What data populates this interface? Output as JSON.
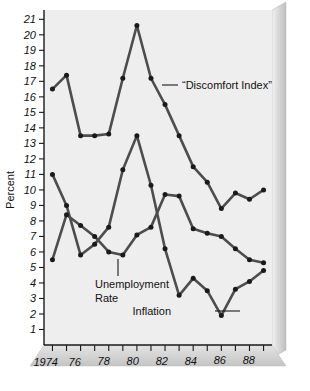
{
  "chart_data": {
    "type": "line",
    "title": "",
    "xlabel": "",
    "ylabel": "Percent",
    "ylim": [
      0,
      21.6
    ],
    "xlim": [
      1973.4,
      1989.6
    ],
    "grid": false,
    "legend_position": "inline-annotations",
    "x": [
      1974,
      1975,
      1976,
      1977,
      1978,
      1979,
      1980,
      1981,
      1982,
      1983,
      1984,
      1985,
      1986,
      1987,
      1988,
      1989
    ],
    "yticks": [
      1,
      2,
      3,
      4,
      5,
      6,
      7,
      8,
      9,
      10,
      11,
      12,
      13,
      14,
      15,
      16,
      17,
      18,
      19,
      20,
      21
    ],
    "ytick_labels": [
      "1",
      "2",
      "3",
      "4",
      "5",
      "6",
      "7",
      "8",
      "9",
      "10",
      "11",
      "12",
      "13",
      "14",
      "15",
      "16",
      "17",
      "18",
      "19",
      "20",
      "21"
    ],
    "xticks": [
      1974,
      1975,
      1976,
      1977,
      1978,
      1979,
      1980,
      1981,
      1982,
      1983,
      1984,
      1985,
      1986,
      1987,
      1988,
      1989
    ],
    "xtick_labels": [
      "1974",
      "",
      "76",
      "",
      "78",
      "",
      "80",
      "",
      "82",
      "",
      "84",
      "",
      "86",
      "",
      "88",
      ""
    ],
    "series": [
      {
        "name": "“Discomfort Index”",
        "label_text": "“Discomfort Index”",
        "color": "#4d4d4d",
        "values": [
          16.5,
          17.4,
          13.5,
          13.5,
          13.6,
          17.2,
          20.6,
          17.2,
          15.5,
          13.5,
          11.5,
          10.5,
          8.8,
          9.8,
          9.4,
          10.0
        ]
      },
      {
        "name": "Unemployment Rate",
        "label_text": "Unemployment\nRate",
        "color": "#4d4d4d",
        "values": [
          5.5,
          8.4,
          7.7,
          7.0,
          6.0,
          5.8,
          7.1,
          7.6,
          9.7,
          9.6,
          7.5,
          7.2,
          7.0,
          6.2,
          5.5,
          5.3
        ]
      },
      {
        "name": "Inflation",
        "label_text": "Inflation",
        "color": "#4d4d4d",
        "values": [
          11.0,
          9.0,
          5.8,
          6.5,
          7.6,
          11.3,
          13.5,
          10.3,
          6.2,
          3.2,
          4.3,
          3.5,
          1.9,
          3.6,
          4.1,
          4.8
        ]
      }
    ],
    "annotations": [
      {
        "id": "discomfort-index-label",
        "text": "“Discomfort Index”"
      },
      {
        "id": "unemployment-rate-label",
        "text": "Unemployment"
      },
      {
        "id": "unemployment-rate-label-2",
        "text": "Rate"
      },
      {
        "id": "inflation-label",
        "text": "Inflation"
      }
    ],
    "colors": {
      "plot_background": "#eeeeee",
      "panel_face": "#ffffff",
      "line": "#4d4d4d",
      "marker": "#1a1a1a",
      "axis": "#1a1a1a",
      "base_plate": "#d0d0d0",
      "bevel": "#c8c8c8"
    }
  }
}
